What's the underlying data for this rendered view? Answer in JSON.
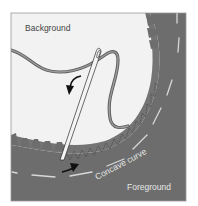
{
  "diagram": {
    "labels": {
      "background": "Background",
      "foreground": "Foreground",
      "curve": "Concave curve"
    },
    "colors": {
      "background_fabric": "#f2f2f2",
      "foreground_fabric": "#6d6d6d",
      "frame_border": "#9a9a9a",
      "stitch_dash": "#d8d8d8",
      "thread": "#6a6a6a",
      "thread_highlight": "#9a9a9a",
      "arrow": "#111111",
      "label_dark": "#444444",
      "label_light": "#e6e6e6"
    },
    "icons": {
      "direction_arrow_top": "curved-arrow-down",
      "direction_arrow_bottom": "curved-arrow-right",
      "needle": "sewing-needle"
    }
  }
}
